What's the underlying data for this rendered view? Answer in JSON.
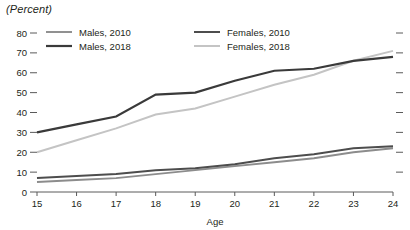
{
  "unit_label": "(Percent)",
  "chart_data": {
    "type": "line",
    "title": "",
    "subtitle": "",
    "unit_label": "(Percent)",
    "xlabel": "Age",
    "ylabel": "",
    "x": [
      15,
      16,
      17,
      18,
      19,
      20,
      21,
      22,
      23,
      24
    ],
    "categories": [
      "15",
      "16",
      "17",
      "18",
      "19",
      "20",
      "21",
      "22",
      "23",
      "24"
    ],
    "xlim": [
      15,
      24
    ],
    "ylim": [
      0,
      80
    ],
    "yticks": [
      0,
      10,
      20,
      30,
      40,
      50,
      60,
      70,
      80
    ],
    "yticklabels": [
      "0",
      "10",
      "20",
      "30",
      "40",
      "50",
      "60",
      "70",
      "80"
    ],
    "xticks": [
      15,
      16,
      17,
      18,
      19,
      20,
      21,
      22,
      23,
      24
    ],
    "xticklabels": [
      "15",
      "16",
      "17",
      "18",
      "19",
      "20",
      "21",
      "22",
      "23",
      "24"
    ],
    "grid": false,
    "legend_position": "top-left-inside",
    "series": [
      {
        "name": "Males, 2010",
        "color": "#8c8c8c",
        "width": 1.9,
        "values": [
          5,
          6,
          7,
          9,
          11,
          13,
          15,
          17,
          20,
          22
        ]
      },
      {
        "name": "Males, 2018",
        "color": "#3a3a3a",
        "width": 2.2,
        "values": [
          30,
          34,
          38,
          49,
          50,
          56,
          61,
          62,
          66,
          68
        ]
      },
      {
        "name": "Females, 2010",
        "color": "#4d4d4d",
        "width": 2.0,
        "values": [
          7,
          8,
          9,
          11,
          12,
          14,
          17,
          19,
          22,
          23
        ]
      },
      {
        "name": "Females, 2018",
        "color": "#c4c4c4",
        "width": 2.0,
        "values": [
          20,
          26,
          32,
          39,
          42,
          48,
          54,
          59,
          66,
          71
        ]
      }
    ]
  },
  "legend": {
    "entries": [
      {
        "label": "Males, 2010",
        "color": "#8c8c8c"
      },
      {
        "label": "Males, 2018",
        "color": "#3a3a3a"
      },
      {
        "label": "Females, 2010",
        "color": "#4d4d4d"
      },
      {
        "label": "Females, 2018",
        "color": "#c4c4c4"
      }
    ]
  },
  "axis": {
    "x_title": "Age",
    "y_tick_labels": [
      "80",
      "70",
      "60",
      "50",
      "40",
      "30",
      "20",
      "10",
      "0"
    ],
    "x_tick_labels": [
      "15",
      "16",
      "17",
      "18",
      "19",
      "20",
      "21",
      "22",
      "23",
      "24"
    ]
  }
}
